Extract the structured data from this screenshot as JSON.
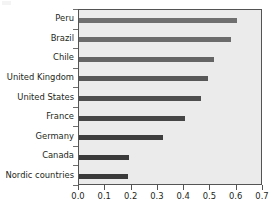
{
  "chart_data": {
    "type": "bar",
    "orientation": "horizontal",
    "title": "",
    "subtitle": "",
    "xlabel": "",
    "ylabel": "",
    "xlim": [
      0.0,
      0.7
    ],
    "grid": false,
    "legend": null,
    "categories": [
      "Peru",
      "Brazil",
      "Chile",
      "United Kingdom",
      "United States",
      "France",
      "Germany",
      "Canada",
      "Nordic countries"
    ],
    "values": [
      0.6,
      0.58,
      0.515,
      0.49,
      0.465,
      0.405,
      0.32,
      0.19,
      0.185
    ],
    "bar_colors": [
      "#6f6f6f",
      "#6b6b6b",
      "#646464",
      "#575757",
      "#4e4e4e",
      "#454545",
      "#3e3e3e",
      "#3a3a3a",
      "#3a3a3a"
    ],
    "xticks": [
      0.0,
      0.1,
      0.2,
      0.3,
      0.4,
      0.5,
      0.6,
      0.7
    ],
    "xtick_labels": [
      "0.0",
      "0.1",
      "0.2",
      "0.3",
      "0.4",
      "0.5",
      "0.6",
      "0.7"
    ],
    "plot_background": "#ebebeb",
    "frame_color": "#545454",
    "text_color": "#231f20"
  }
}
